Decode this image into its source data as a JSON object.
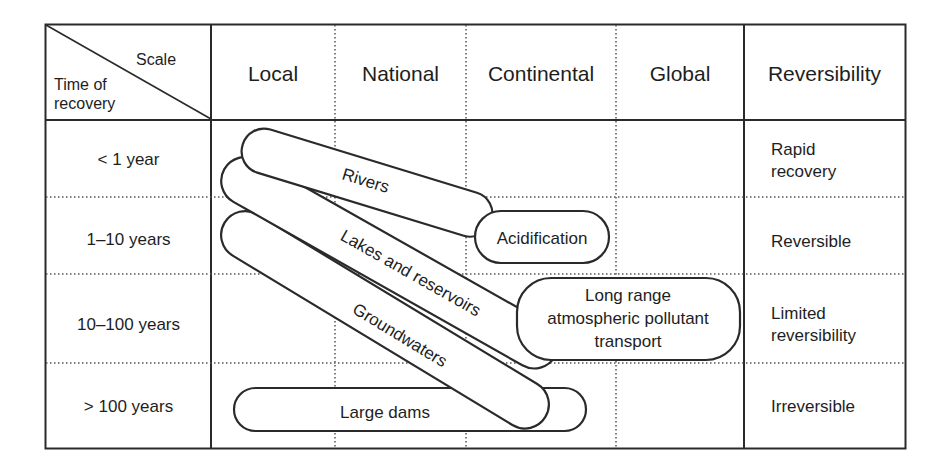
{
  "corner": {
    "top_right": "Scale",
    "bottom_left_line1": "Time of",
    "bottom_left_line2": "recovery"
  },
  "columns": [
    "Local",
    "National",
    "Continental",
    "Global",
    "Reversibility"
  ],
  "rows": [
    {
      "time": "< 1 year",
      "reversibility_line1": "Rapid",
      "reversibility_line2": "recovery"
    },
    {
      "time": "1–10  years",
      "reversibility_line1": "Reversible",
      "reversibility_line2": ""
    },
    {
      "time": "10–100  years",
      "reversibility_line1": "Limited",
      "reversibility_line2": "reversibility"
    },
    {
      "time": "> 100  years",
      "reversibility_line1": "Irreversible",
      "reversibility_line2": ""
    }
  ],
  "shapes": {
    "rivers": "Rivers",
    "lakes": "Lakes and reservoirs",
    "groundwaters": "Groundwaters",
    "large_dams": "Large dams",
    "acidification": "Acidification",
    "long_range_line1": "Long range",
    "long_range_line2": "atmospheric pollutant",
    "long_range_line3": "transport"
  },
  "colors": {
    "line": "#2a2a2a",
    "background": "#ffffff",
    "text": "#1e1e1e"
  }
}
